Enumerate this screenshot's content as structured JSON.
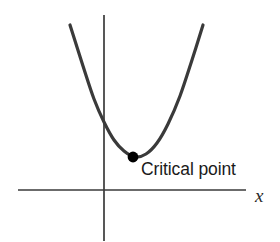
{
  "figure": {
    "width": 280,
    "height": 242,
    "background": "#ffffff",
    "curve_color": "#3a3a3a",
    "axis_color": "#3a3a3a",
    "point_color": "#000000",
    "text_color": "#1a1a1a"
  },
  "labels": {
    "critical_point": "Critical point",
    "x_axis": "x"
  },
  "chart_data": {
    "type": "line",
    "title": "",
    "subtitle": "",
    "xlabel": "x",
    "ylabel": "",
    "grid": false,
    "legend": null,
    "annotations": [
      {
        "text": "Critical point",
        "target_x": 133,
        "target_y": 157,
        "label_x": 141,
        "label_y": 178
      }
    ],
    "axes": {
      "x_axis": {
        "x1": 18,
        "y1": 190,
        "x2": 246,
        "y2": 190
      },
      "y_axis": {
        "x1": 104,
        "y1": 15,
        "x2": 104,
        "y2": 241
      },
      "origin": {
        "x": 104,
        "y": 190
      }
    },
    "series": [
      {
        "name": "parabola",
        "shape": "upward parabola",
        "color": "#3a3a3a",
        "stroke_width": 3.2,
        "vertex": {
          "x": 135,
          "y": 157
        },
        "points": [
          {
            "x": 70,
            "y": 25
          },
          {
            "x": 83,
            "y": 66
          },
          {
            "x": 94,
            "y": 99
          },
          {
            "x": 104,
            "y": 122
          },
          {
            "x": 114,
            "y": 140
          },
          {
            "x": 124,
            "y": 151
          },
          {
            "x": 135,
            "y": 157
          },
          {
            "x": 146,
            "y": 154
          },
          {
            "x": 157,
            "y": 143
          },
          {
            "x": 168,
            "y": 124
          },
          {
            "x": 180,
            "y": 96
          },
          {
            "x": 192,
            "y": 60
          },
          {
            "x": 203,
            "y": 25
          }
        ]
      }
    ],
    "markers": [
      {
        "name": "critical-point-marker",
        "x": 133,
        "y": 157,
        "radius": 5.4,
        "color": "#000000",
        "style": "filled-circle"
      }
    ]
  }
}
